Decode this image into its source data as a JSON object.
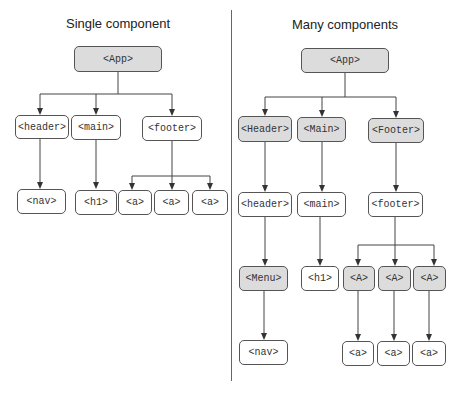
{
  "left_panel": {
    "title": "Single component",
    "nodes": {
      "app": "<App>",
      "header": "<header>",
      "main": "<main>",
      "footer": "<footer>",
      "nav": "<nav>",
      "h1": "<h1>",
      "a1": "<a>",
      "a2": "<a>",
      "a3": "<a>"
    }
  },
  "right_panel": {
    "title": "Many components",
    "nodes": {
      "app": "<App>",
      "header_component": "<Header>",
      "main_component": "<Main>",
      "footer_component": "<Footer>",
      "header": "<header>",
      "main": "<main>",
      "footer": "<footer>",
      "menu_component": "<Menu>",
      "h1": "<h1>",
      "a_component_1": "<A>",
      "a_component_2": "<A>",
      "a_component_3": "<A>",
      "nav": "<nav>",
      "a1": "<a>",
      "a2": "<a>",
      "a3": "<a>"
    }
  },
  "legend": {
    "component_fill": "#dcdcdc",
    "element_fill": "#ffffff"
  }
}
